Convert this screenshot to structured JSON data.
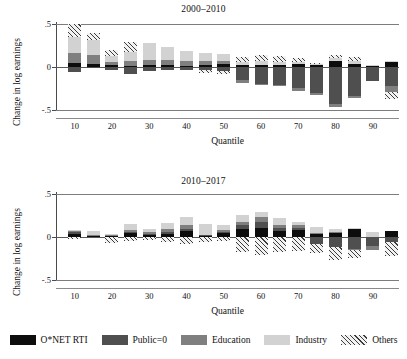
{
  "figure": {
    "ylabel": "Change in log earnings",
    "xlabel": "Quantile"
  },
  "legend": {
    "items": [
      {
        "label": "O*NET RTI",
        "key": "rti",
        "color": "#0d0d0d",
        "swatch": "solid"
      },
      {
        "label": "Public=0",
        "key": "public",
        "color": "#4f4f4f",
        "swatch": "solid"
      },
      {
        "label": "Education",
        "key": "edu",
        "color": "#7f7f7f",
        "swatch": "solid"
      },
      {
        "label": "Industry",
        "key": "ind",
        "color": "#d2d2d2",
        "swatch": "solid"
      },
      {
        "label": "Others",
        "key": "oth",
        "color": "#3c3c3c",
        "swatch": "hatched"
      }
    ]
  },
  "chart_data": [
    {
      "id": "panel-top",
      "type": "bar",
      "stacked": true,
      "title": "2000–2010",
      "xlabel": "Quantile",
      "ylabel": "Change in log earnings",
      "ylim": [
        -0.5,
        0.5
      ],
      "yticks": [
        0.5,
        0,
        -0.5
      ],
      "ytick_labels": [
        ".5",
        "0",
        "-.5"
      ],
      "xlim": [
        5,
        97
      ],
      "xticks": [
        10,
        20,
        30,
        40,
        50,
        60,
        70,
        80,
        90
      ],
      "grid": true,
      "categories": [
        10,
        15,
        20,
        25,
        30,
        35,
        40,
        45,
        50,
        55,
        60,
        65,
        70,
        75,
        80,
        85,
        90,
        95
      ],
      "series": [
        {
          "name": "O*NET RTI",
          "key": "rti",
          "values": [
            0.045,
            0.035,
            0.018,
            0.012,
            0.02,
            0.018,
            0.015,
            0.022,
            0.03,
            0.028,
            0.022,
            0.018,
            0.035,
            0.028,
            0.07,
            0.04,
            0.01,
            0.055
          ]
        },
        {
          "name": "Public=0",
          "key": "public",
          "values": [
            -0.055,
            -0.015,
            -0.035,
            -0.085,
            -0.045,
            -0.04,
            -0.035,
            -0.04,
            -0.045,
            -0.155,
            -0.195,
            -0.205,
            -0.245,
            -0.3,
            -0.43,
            -0.34,
            -0.16,
            -0.225
          ]
        },
        {
          "name": "Education",
          "key": "edu",
          "values": [
            0.12,
            0.1,
            0.04,
            0.06,
            0.065,
            0.065,
            0.06,
            0.045,
            0.035,
            -0.03,
            -0.015,
            -0.01,
            -0.03,
            -0.03,
            -0.035,
            -0.025,
            0.0,
            -0.065
          ]
        },
        {
          "name": "Industry",
          "key": "ind",
          "values": [
            0.185,
            0.175,
            0.075,
            0.1,
            0.195,
            0.155,
            0.11,
            0.09,
            0.09,
            0.035,
            0.05,
            0.045,
            0.02,
            0.005,
            0.03,
            0.025,
            0.01,
            0.02
          ]
        },
        {
          "name": "Others",
          "key": "oth",
          "values": [
            0.155,
            0.09,
            0.06,
            0.115,
            0.0,
            0.0,
            0.0,
            -0.035,
            -0.04,
            0.055,
            0.065,
            0.07,
            0.055,
            0.01,
            0.04,
            0.055,
            0.0,
            -0.085
          ]
        }
      ]
    },
    {
      "id": "panel-bottom",
      "type": "bar",
      "stacked": true,
      "title": "2010–2017",
      "xlabel": "Quantile",
      "ylabel": "Change in log earnings",
      "ylim": [
        -0.5,
        0.5
      ],
      "yticks": [
        0.5,
        0,
        -0.5
      ],
      "ytick_labels": [
        ".5",
        "0",
        "-.5"
      ],
      "xlim": [
        5,
        97
      ],
      "xticks": [
        10,
        20,
        30,
        40,
        50,
        60,
        70,
        80,
        90
      ],
      "grid": true,
      "categories": [
        10,
        15,
        20,
        25,
        30,
        35,
        40,
        45,
        50,
        55,
        60,
        65,
        70,
        75,
        80,
        85,
        90,
        95
      ],
      "series": [
        {
          "name": "O*NET RTI",
          "key": "rti",
          "values": [
            0.03,
            0.012,
            0.01,
            0.048,
            0.03,
            0.04,
            0.07,
            0.015,
            0.045,
            0.09,
            0.1,
            0.075,
            0.08,
            0.035,
            0.045,
            0.09,
            0.0,
            0.075
          ]
        },
        {
          "name": "Public=0",
          "key": "public",
          "values": [
            0.025,
            0.008,
            0.01,
            0.012,
            0.008,
            0.015,
            0.025,
            0.005,
            0.015,
            0.045,
            0.075,
            0.03,
            0.03,
            -0.08,
            -0.12,
            -0.145,
            -0.105,
            -0.06
          ]
        },
        {
          "name": "Education",
          "key": "edu",
          "values": [
            0.012,
            0.008,
            0.006,
            0.02,
            0.015,
            0.035,
            0.045,
            0.0,
            0.02,
            0.035,
            0.055,
            0.035,
            0.025,
            0.01,
            0.01,
            -0.005,
            -0.045,
            0.0
          ]
        },
        {
          "name": "Industry",
          "key": "ind",
          "values": [
            0.018,
            0.045,
            0.008,
            0.07,
            0.045,
            0.07,
            0.09,
            0.13,
            0.06,
            0.085,
            0.055,
            0.085,
            0.045,
            0.075,
            0.04,
            0.02,
            0.055,
            0.0
          ]
        },
        {
          "name": "Others",
          "key": "oth",
          "values": [
            -0.022,
            0.0,
            -0.075,
            -0.045,
            -0.04,
            -0.055,
            -0.085,
            -0.055,
            -0.045,
            -0.175,
            -0.21,
            -0.175,
            -0.165,
            -0.105,
            -0.145,
            -0.1,
            0.0,
            -0.165
          ]
        }
      ]
    }
  ]
}
